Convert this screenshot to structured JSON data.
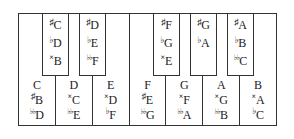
{
  "diagram": {
    "type": "piano-octave",
    "border_color": "#333333",
    "white_key_color": "#ffffff",
    "black_key_color": "#ffffff",
    "text_color": "#1a1a1a"
  },
  "white_keys": [
    {
      "name": "C",
      "labels": [
        {
          "accidental": "",
          "letter": "C"
        },
        {
          "accidental": "sharp",
          "letter": "B"
        },
        {
          "accidental": "double-flat",
          "letter": "D"
        }
      ]
    },
    {
      "name": "D",
      "labels": [
        {
          "accidental": "",
          "letter": "D"
        },
        {
          "accidental": "double-sharp",
          "letter": "C"
        },
        {
          "accidental": "double-flat",
          "letter": "E"
        }
      ]
    },
    {
      "name": "E",
      "labels": [
        {
          "accidental": "",
          "letter": "E"
        },
        {
          "accidental": "double-sharp",
          "letter": "D"
        },
        {
          "accidental": "flat",
          "letter": "F"
        }
      ]
    },
    {
      "name": "F",
      "labels": [
        {
          "accidental": "",
          "letter": "F"
        },
        {
          "accidental": "sharp",
          "letter": "E"
        },
        {
          "accidental": "double-flat",
          "letter": "G"
        }
      ]
    },
    {
      "name": "G",
      "labels": [
        {
          "accidental": "",
          "letter": "G"
        },
        {
          "accidental": "double-sharp",
          "letter": "F"
        },
        {
          "accidental": "double-flat",
          "letter": "A"
        }
      ]
    },
    {
      "name": "A",
      "labels": [
        {
          "accidental": "",
          "letter": "A"
        },
        {
          "accidental": "double-sharp",
          "letter": "G"
        },
        {
          "accidental": "double-flat",
          "letter": "B"
        }
      ]
    },
    {
      "name": "B",
      "labels": [
        {
          "accidental": "",
          "letter": "B"
        },
        {
          "accidental": "double-sharp",
          "letter": "A"
        },
        {
          "accidental": "flat",
          "letter": "C"
        }
      ]
    }
  ],
  "black_keys": [
    {
      "name": "C-sharp",
      "left": 23,
      "labels": [
        {
          "accidental": "sharp",
          "letter": "C"
        },
        {
          "accidental": "flat",
          "letter": "D"
        },
        {
          "accidental": "double-sharp",
          "letter": "B"
        }
      ]
    },
    {
      "name": "D-sharp",
      "left": 60,
      "labels": [
        {
          "accidental": "sharp",
          "letter": "D"
        },
        {
          "accidental": "flat",
          "letter": "E"
        },
        {
          "accidental": "double-flat",
          "letter": "F"
        }
      ]
    },
    {
      "name": "F-sharp",
      "left": 134,
      "labels": [
        {
          "accidental": "sharp",
          "letter": "F"
        },
        {
          "accidental": "flat",
          "letter": "G"
        },
        {
          "accidental": "double-sharp",
          "letter": "E"
        }
      ]
    },
    {
      "name": "G-sharp",
      "left": 171,
      "labels": [
        {
          "accidental": "sharp",
          "letter": "G"
        },
        {
          "accidental": "flat",
          "letter": "A"
        }
      ]
    },
    {
      "name": "A-sharp",
      "left": 208,
      "labels": [
        {
          "accidental": "sharp",
          "letter": "A"
        },
        {
          "accidental": "flat",
          "letter": "B"
        },
        {
          "accidental": "double-flat",
          "letter": "C"
        }
      ]
    }
  ],
  "accidental_glyphs": {
    "sharp": "♯",
    "flat": "♭",
    "double-flat": "♭♭",
    "double-sharp": "×",
    "": ""
  }
}
